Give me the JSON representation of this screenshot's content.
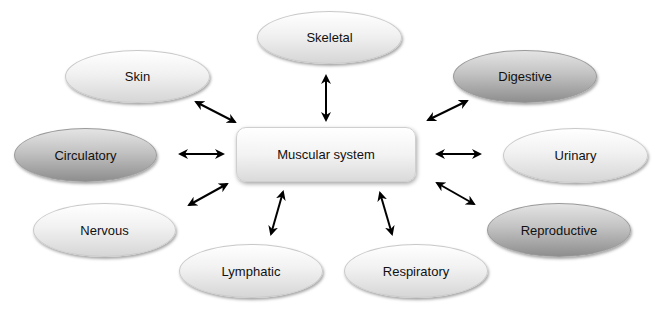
{
  "diagram": {
    "center": {
      "label": "Muscular system"
    },
    "nodes": [
      {
        "id": "skin",
        "label": "Skin",
        "shade": "light"
      },
      {
        "id": "skeletal",
        "label": "Skeletal",
        "shade": "light"
      },
      {
        "id": "digestive",
        "label": "Digestive",
        "shade": "dark"
      },
      {
        "id": "circulatory",
        "label": "Circulatory",
        "shade": "dark"
      },
      {
        "id": "urinary",
        "label": "Urinary",
        "shade": "light"
      },
      {
        "id": "nervous",
        "label": "Nervous",
        "shade": "light"
      },
      {
        "id": "reproductive",
        "label": "Reproductive",
        "shade": "dark"
      },
      {
        "id": "lymphatic",
        "label": "Lymphatic",
        "shade": "light"
      },
      {
        "id": "respiratory",
        "label": "Respiratory",
        "shade": "light"
      }
    ],
    "connections": "bidirectional arrows from Muscular system to each node",
    "colors": {
      "light_fill": "#f1f1f1",
      "dark_fill": "#b5b5b5",
      "arrow": "#000000"
    }
  }
}
